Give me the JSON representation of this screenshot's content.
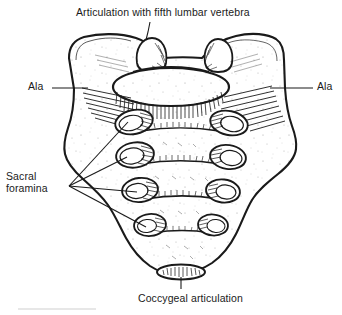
{
  "figure": {
    "background_color": "#ffffff",
    "ink_color": "#1a1a1a",
    "width": 342,
    "height": 315
  },
  "labels": {
    "articulation_fifth_lumbar": "Articulation with fifth lumbar vertebra",
    "ala_left": "Ala",
    "ala_right": "Ala",
    "sacral_foramina": "Sacral\nforamina",
    "coccygeal_articulation": "Coccygeal articulation"
  },
  "anatomy": {
    "foramina_pairs": 4,
    "superior_articular_processes": 2,
    "transverse_ridges": 4,
    "promontory": "oval superior surface",
    "apex_facet": "coccygeal articular facet"
  }
}
